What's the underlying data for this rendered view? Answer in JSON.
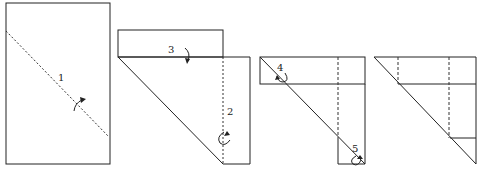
{
  "diagram": {
    "type": "folding-instructions",
    "steps": [
      {
        "id": "1",
        "label": "1",
        "description": "fold along dotted diagonal"
      },
      {
        "id": "2",
        "label": "2",
        "description": "fold along dotted vertical"
      },
      {
        "id": "3",
        "label": "3",
        "description": "fold top flap down"
      },
      {
        "id": "4",
        "label": "4",
        "description": "fold top-left corner"
      },
      {
        "id": "5",
        "label": "5",
        "description": "fold bottom-right corner"
      }
    ],
    "panels": [
      {
        "name": "panel-1",
        "labels": [
          "1"
        ]
      },
      {
        "name": "panel-2",
        "labels": [
          "3",
          "2"
        ]
      },
      {
        "name": "panel-3",
        "labels": [
          "4",
          "5"
        ]
      },
      {
        "name": "panel-4",
        "labels": []
      }
    ],
    "colors": {
      "line": "#222222",
      "background": "#ffffff"
    }
  }
}
